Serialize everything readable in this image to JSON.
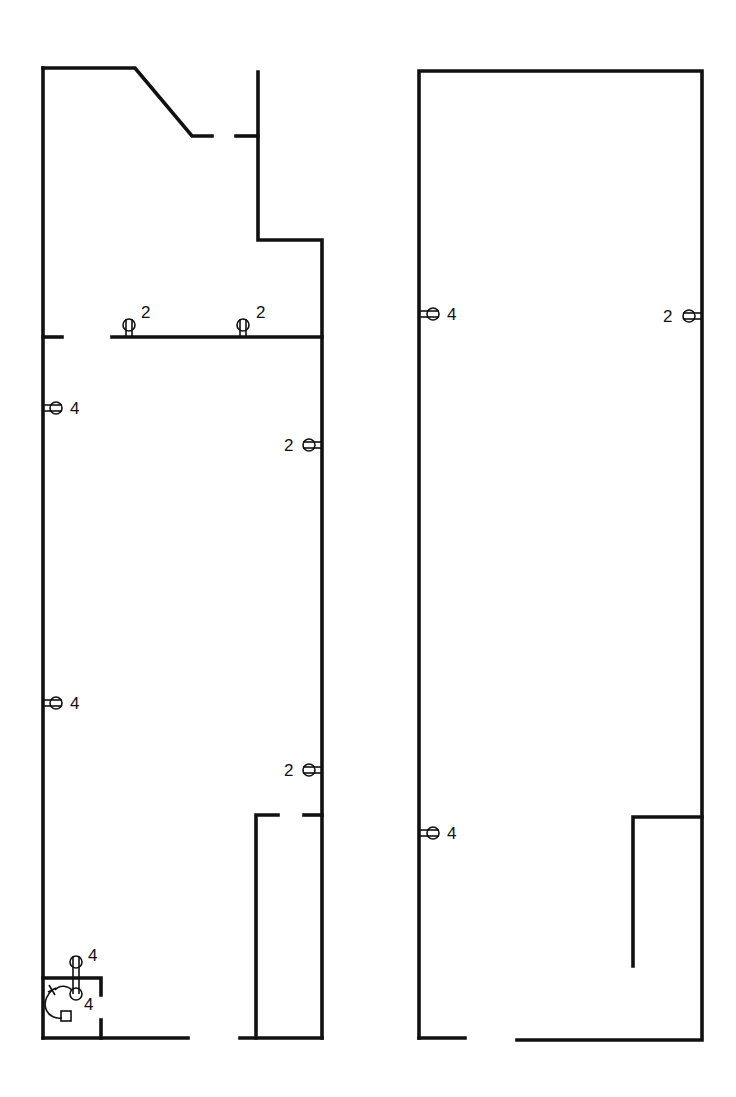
{
  "diagram": {
    "type": "floor-plan-electrical",
    "plans": [
      {
        "id": "left-plan",
        "outlets": [
          {
            "id": "top-wall-outlet-1",
            "circuit": "2",
            "wall": "horizontal-partition"
          },
          {
            "id": "top-wall-outlet-2",
            "circuit": "2",
            "wall": "horizontal-partition"
          },
          {
            "id": "left-wall-outlet-1",
            "circuit": "4",
            "wall": "left"
          },
          {
            "id": "right-wall-outlet-1",
            "circuit": "2",
            "wall": "right"
          },
          {
            "id": "left-wall-outlet-2",
            "circuit": "4",
            "wall": "left"
          },
          {
            "id": "right-wall-outlet-2",
            "circuit": "2",
            "wall": "right"
          },
          {
            "id": "closet-outlet-upper",
            "circuit": "4",
            "wall": "closet-top"
          },
          {
            "id": "closet-outlet-lower",
            "circuit": "4",
            "wall": "closet-top"
          }
        ]
      },
      {
        "id": "right-plan",
        "outlets": [
          {
            "id": "left-wall-outlet-1",
            "circuit": "4",
            "wall": "left"
          },
          {
            "id": "right-wall-outlet-1",
            "circuit": "2",
            "wall": "right"
          },
          {
            "id": "left-wall-outlet-2",
            "circuit": "4",
            "wall": "left"
          }
        ]
      }
    ],
    "legend": {
      "outlet_symbol": "duplex-receptacle",
      "number_meaning": "circuit"
    }
  }
}
